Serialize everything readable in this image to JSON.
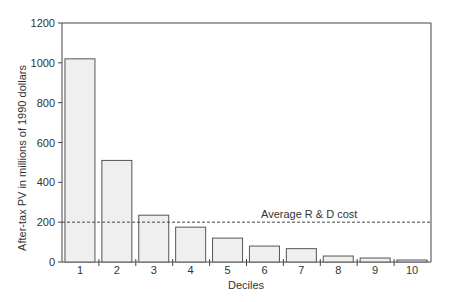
{
  "chart_data": {
    "type": "bar",
    "title": "",
    "xlabel": "Deciles",
    "ylabel": "After-tax PV in millions of 1990 dollars",
    "categories": [
      "1",
      "2",
      "3",
      "4",
      "5",
      "6",
      "7",
      "8",
      "9",
      "10"
    ],
    "values": [
      1020,
      510,
      235,
      175,
      120,
      80,
      67,
      30,
      20,
      10
    ],
    "ylim": [
      0,
      1200
    ],
    "yticks": [
      0,
      200,
      400,
      600,
      800,
      1000,
      1200
    ],
    "grid": false,
    "legend": null,
    "reference_line": {
      "value": 200,
      "label": "Average R & D cost",
      "style": "dashed"
    },
    "bar_fill": "#efefef",
    "bar_stroke": "#555555"
  }
}
